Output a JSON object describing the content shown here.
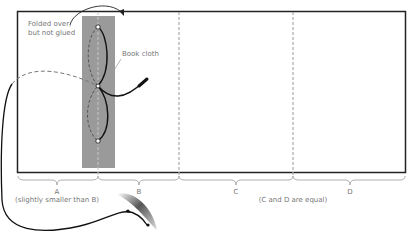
{
  "annotations": {
    "folded_line1": "Folded over,",
    "folded_line2": "but not glued",
    "book_cloth": "Book cloth"
  },
  "sections": [
    {
      "label": "A",
      "note": "(slightly smaller than B)"
    },
    {
      "label": "B",
      "note": ""
    },
    {
      "label": "C",
      "note": ""
    },
    {
      "label": "D",
      "note": ""
    }
  ],
  "cd_note": "(C and D are equal)",
  "colors": {
    "outline": "#222222",
    "book_cloth": "#9a9a9a",
    "fold_line": "#aaaaaa",
    "text": "#777777",
    "thread": "#111111"
  }
}
